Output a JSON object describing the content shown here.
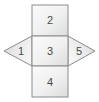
{
  "figure": {
    "name": "polyhedron-net-diagram",
    "type": "net-diagram",
    "background_color": "#ffffff",
    "stroke_color": "#808080",
    "fill_light": "#f2f2f2",
    "fill_dark": "#d8d8d8",
    "label_color": "#4a4a4a"
  },
  "faces": [
    {
      "id": "face-top",
      "shape": "square",
      "label": "2",
      "position": "top",
      "label_x": 50,
      "label_y": 20
    },
    {
      "id": "face-left",
      "shape": "triangle",
      "label": "1",
      "position": "left",
      "label_x": 21,
      "label_y": 51
    },
    {
      "id": "face-center",
      "shape": "square",
      "label": "3",
      "position": "center",
      "label_x": 50,
      "label_y": 51
    },
    {
      "id": "face-right",
      "shape": "triangle",
      "label": "5",
      "position": "right",
      "label_x": 79,
      "label_y": 51
    },
    {
      "id": "face-bottom",
      "shape": "square",
      "label": "4",
      "position": "bottom",
      "label_x": 50,
      "label_y": 82
    }
  ]
}
